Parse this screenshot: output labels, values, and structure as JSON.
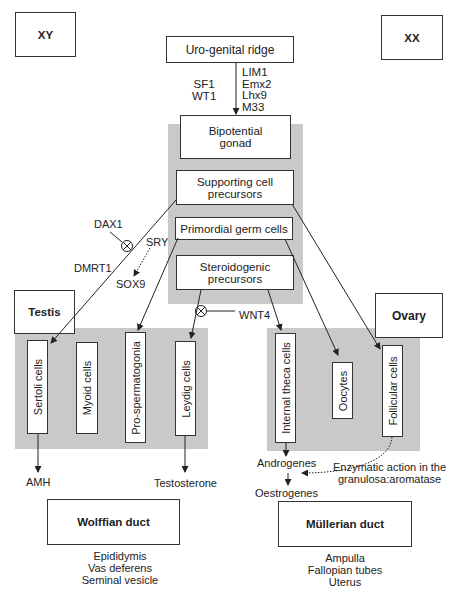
{
  "corners": {
    "xy_label": "XY",
    "xx_label": "XX"
  },
  "top": {
    "urogenital_ridge": "Uro-genital ridge",
    "left_factors": [
      "SF1",
      "WT1"
    ],
    "right_factors": [
      "LIM1",
      "Emx2",
      "Lhx9",
      "M33"
    ]
  },
  "gonad_column": {
    "bipotential": [
      "Bipotential",
      "gonad"
    ],
    "supporting": [
      "Supporting cell",
      "precursors"
    ],
    "germ": "Primordial germ cells",
    "steroidogenic": [
      "Steroidogenic",
      "precursors"
    ]
  },
  "regulators": {
    "dax1": "DAX1",
    "sry": "SRY",
    "dmrt1": "DMRT1",
    "sox9": "SOX9",
    "wnt4": "WNT4"
  },
  "testis": {
    "title": "Testis",
    "cells": [
      "Sertoli cells",
      "Myoid cells",
      "Pro-spermatogonia",
      "Leydig cells"
    ],
    "outputs": {
      "amh": "AMH",
      "testosterone": "Testosterone"
    }
  },
  "ovary": {
    "title": "Ovary",
    "cells": [
      "Internal theca cells",
      "Oocytes",
      "Follicular cells"
    ],
    "androgenes": "Androgenes",
    "oestrogenes": "Oestrogenes",
    "enzymatic_note": [
      "Enzymatic action in the",
      "granulosa:aromatase"
    ]
  },
  "ducts": {
    "wolffian": {
      "title": "Wolffian duct",
      "derivatives": [
        "Epididymis",
        "Vas deferens",
        "Seminal vesicle"
      ]
    },
    "mullerian": {
      "title": "Müllerian duct",
      "derivatives": [
        "Ampulla",
        "Fallopian tubes",
        "Uterus"
      ]
    }
  },
  "colors": {
    "shade": "#c9c9c9",
    "line": "#222222",
    "border": "#333333"
  }
}
